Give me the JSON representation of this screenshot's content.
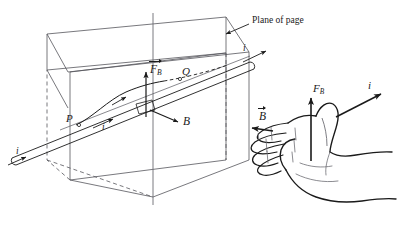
{
  "figure": {
    "background_color": "#ffffff",
    "line_color": "#3f3f46",
    "ink_color": "#1a1a1a",
    "width": 408,
    "height": 228
  },
  "left_diagram": {
    "name": "wire-in-magnetic-field-3d",
    "annotations": {
      "plane_of_page": "Plane of page",
      "point_p": "P",
      "point_q": "Q",
      "force_symbol": "F",
      "force_subscript": "B",
      "field_symbol": "B",
      "current_symbol": "i",
      "current_lower_left": "i",
      "current_upper_right": "i",
      "current_on_wire": "i"
    }
  },
  "right_diagram": {
    "name": "right-hand-rule-hand",
    "annotations": {
      "force_symbol": "F",
      "force_subscript": "B",
      "field_symbol": "B",
      "current_symbol": "i"
    }
  }
}
